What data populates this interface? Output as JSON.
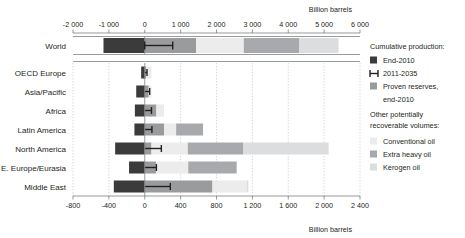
{
  "chart_data": {
    "type": "bar",
    "orientation": "horizontal",
    "title": "",
    "subtitle": "",
    "top_axis_label": "Billion barrels",
    "bottom_axis_label": "Billion barrels",
    "xlabel": "Billion barrels",
    "ylabel": "",
    "grid": true,
    "legend_position": "right",
    "world_axis": {
      "xlim": [
        -2000,
        6000
      ],
      "ticks": [
        -2000,
        -1000,
        0,
        1000,
        2000,
        3000,
        4000,
        5000,
        6000
      ],
      "tick_labels": [
        "-2 000",
        "-1 000",
        "0",
        "1 000",
        "2 000",
        "3 000",
        "4 000",
        "5 000",
        "6 000"
      ]
    },
    "region_axis": {
      "xlim": [
        -800,
        2400
      ],
      "ticks": [
        -800,
        -400,
        0,
        400,
        800,
        1200,
        1600,
        2000,
        2400
      ],
      "tick_labels": [
        "-800",
        "-400",
        "0",
        "400",
        "800",
        "1 200",
        "1 600",
        "2 000",
        "2 400"
      ]
    },
    "series": [
      {
        "name": "End-2010",
        "key": "cumulative_production_end_2010",
        "color": "#3b3b3b",
        "direction": "negative"
      },
      {
        "name": "2011-2035",
        "key": "production_2011_2035",
        "color": "#231f20",
        "marker": "error-bar"
      },
      {
        "name": "Proven reserves, end-2010",
        "key": "proven_reserves_end_2010",
        "color": "#9a9b9d"
      },
      {
        "name": "Conventional oil",
        "key": "conventional_oil",
        "color": "#ececec"
      },
      {
        "name": "Extra heavy oil",
        "key": "extra_heavy_oil",
        "color": "#a7a9ac"
      },
      {
        "name": "Kerogen oil",
        "key": "kerogen_oil",
        "color": "#dcdddf"
      }
    ],
    "world": {
      "category": "World",
      "cumulative_production_end_2010": 1150,
      "production_2011_2035": 780,
      "proven_reserves_end_2010": 1430,
      "conventional_oil": 1330,
      "extra_heavy_oil": 1540,
      "kerogen_oil": 1100
    },
    "categories": [
      "OECD Europe",
      "Asia/Pacific",
      "Africa",
      "Latin America",
      "North America",
      "E. Europe/Eurasia",
      "Middle East"
    ],
    "regions": [
      {
        "category": "OECD Europe",
        "cumulative_production_end_2010": 40,
        "production_2011_2035": 25,
        "proven_reserves_end_2010": 15,
        "conventional_oil": 60,
        "extra_heavy_oil": 0,
        "kerogen_oil": 0
      },
      {
        "category": "Asia/Pacific",
        "cumulative_production_end_2010": 95,
        "production_2011_2035": 55,
        "proven_reserves_end_2010": 45,
        "conventional_oil": 30,
        "extra_heavy_oil": 0,
        "kerogen_oil": 0
      },
      {
        "category": "Africa",
        "cumulative_production_end_2010": 110,
        "production_2011_2035": 75,
        "proven_reserves_end_2010": 130,
        "conventional_oil": 85,
        "extra_heavy_oil": 0,
        "kerogen_oil": 0
      },
      {
        "category": "Latin America",
        "cumulative_production_end_2010": 115,
        "production_2011_2035": 80,
        "proven_reserves_end_2010": 215,
        "conventional_oil": 135,
        "extra_heavy_oil": 300,
        "kerogen_oil": 0
      },
      {
        "category": "North America",
        "cumulative_production_end_2010": 330,
        "production_2011_2035": 185,
        "proven_reserves_end_2010": 75,
        "conventional_oil": 405,
        "extra_heavy_oil": 620,
        "kerogen_oil": 950
      },
      {
        "category": "E. Europe/Eurasia",
        "cumulative_production_end_2010": 175,
        "production_2011_2035": 130,
        "proven_reserves_end_2010": 125,
        "conventional_oil": 360,
        "extra_heavy_oil": 540,
        "kerogen_oil": 0
      },
      {
        "category": "Middle East",
        "cumulative_production_end_2010": 345,
        "production_2011_2035": 285,
        "proven_reserves_end_2010": 755,
        "conventional_oil": 380,
        "extra_heavy_oil": 0,
        "kerogen_oil": 20
      }
    ]
  },
  "legend": {
    "group1_title": "Cumulative production:",
    "items1": [
      {
        "label": "End-2010",
        "swatch": "dark-square",
        "color": "#3b3b3b"
      },
      {
        "label": "2011-2035",
        "swatch": "error-bar",
        "color": "#231f20"
      },
      {
        "label": "Proven reserves,",
        "label2": "end-2010",
        "swatch": "square",
        "color": "#9a9b9d"
      }
    ],
    "group2_title_line1": "Other potentially",
    "group2_title_line2": "recoverable volumes:",
    "items2": [
      {
        "label": "Conventional oil",
        "swatch": "square",
        "color": "#ececec"
      },
      {
        "label": "Extra heavy oil",
        "swatch": "square",
        "color": "#a7a9ac"
      },
      {
        "label": "Kerogen oil",
        "swatch": "square",
        "color": "#dcdddf"
      }
    ]
  },
  "colors": {
    "end_2010": "#3b3b3b",
    "proven_reserves": "#9a9b9d",
    "conventional": "#ececec",
    "extra_heavy": "#a7a9ac",
    "kerogen": "#dcdddf",
    "axis": "#6d6e71",
    "grid": "#bcbec0",
    "text": "#231f20"
  }
}
